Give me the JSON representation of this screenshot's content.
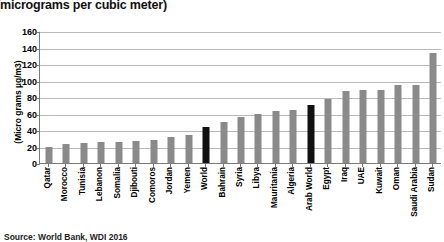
{
  "chart_data": {
    "type": "bar",
    "title": "(micrograms per cubic meter)",
    "xlabel": "",
    "ylabel": "(Micro grams µg/m3)",
    "ylim": [
      0,
      160
    ],
    "ytick_step": 20,
    "yticks": [
      0,
      20,
      40,
      60,
      80,
      100,
      120,
      140,
      160
    ],
    "grid": true,
    "legend": "none",
    "categories": [
      "Qatar",
      "Morocco",
      "Tunisia",
      "Lebanon",
      "Somalia",
      "Djibouti",
      "Comoros",
      "Jordan",
      "Yemen",
      "World",
      "Bahrain",
      "Syria",
      "Libya",
      "Mauritania",
      "Algeria",
      "Arab World",
      "Egypt",
      "Iraq",
      "UAE",
      "Kuwait",
      "Oman",
      "Saudi Arabia",
      "Sudan"
    ],
    "values": [
      19,
      23,
      24,
      25,
      25,
      27,
      28,
      31,
      34,
      44,
      50,
      56,
      60,
      63,
      64,
      70,
      77,
      87,
      88,
      88,
      95,
      95,
      133
    ],
    "highlight_categories": [
      "World",
      "Arab World"
    ],
    "bar_color": "#8a8a8a",
    "highlight_color": "#111111",
    "grid_color": "#b9b9b9",
    "axis_color": "#7a7a7a"
  },
  "footer": {
    "source": "Source: World Bank, WDI 2016"
  }
}
